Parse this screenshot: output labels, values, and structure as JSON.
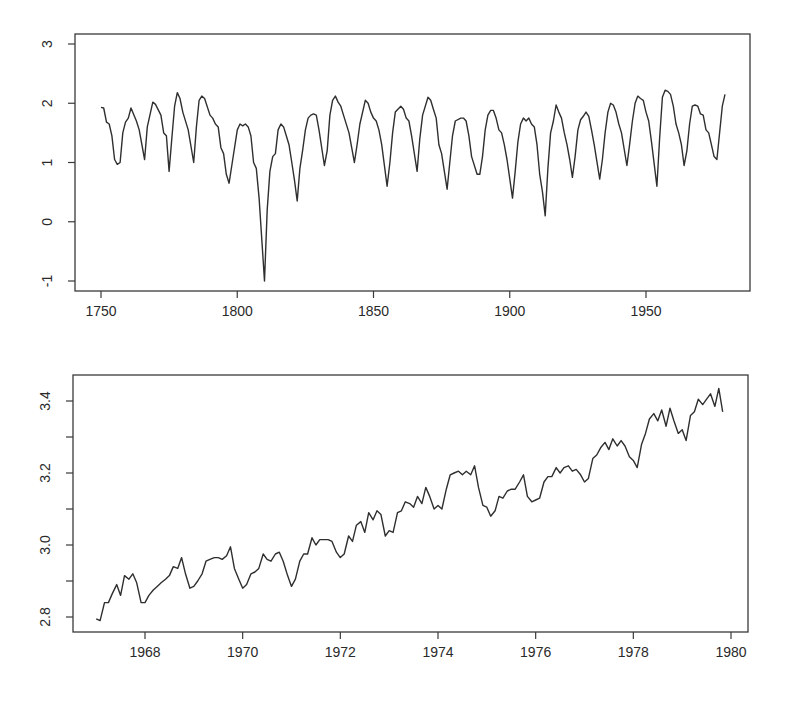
{
  "chart_data": [
    {
      "type": "line",
      "title": "",
      "xlabel": "",
      "ylabel": "",
      "xlim": [
        1740,
        1985
      ],
      "ylim": [
        -1.15,
        3.2
      ],
      "grid": false,
      "legend": null,
      "x_ticks": [
        1750,
        1800,
        1850,
        1900,
        1950
      ],
      "x_tick_labels": [
        "1750",
        "1800",
        "1850",
        "1900",
        "1950"
      ],
      "y_ticks": [
        -1,
        0,
        1,
        2,
        3
      ],
      "y_tick_labels": [
        "-1",
        "0",
        "1",
        "2",
        "3"
      ],
      "series": [
        {
          "name": "series",
          "x": [
            1750,
            1751,
            1752,
            1753,
            1754,
            1755,
            1756,
            1757,
            1758,
            1759,
            1760,
            1761,
            1763,
            1764,
            1766,
            1767,
            1769,
            1770,
            1772,
            1773,
            1774,
            1775,
            1776,
            1777,
            1778,
            1779,
            1780,
            1782,
            1784,
            1785,
            1786,
            1787,
            1788,
            1790,
            1791,
            1792,
            1793,
            1794,
            1795,
            1796,
            1797,
            1798,
            1800,
            1801,
            1802,
            1803,
            1804,
            1805,
            1806,
            1807,
            1808,
            1809,
            1810,
            1811,
            1812,
            1813,
            1814,
            1815,
            1816,
            1817,
            1818,
            1819,
            1820,
            1821,
            1822,
            1823,
            1824,
            1825,
            1826,
            1827,
            1828,
            1829,
            1830,
            1832,
            1833,
            1834,
            1835,
            1836,
            1837,
            1838,
            1839,
            1841,
            1842,
            1843,
            1844,
            1845,
            1847,
            1848,
            1849,
            1850,
            1851,
            1852,
            1853,
            1855,
            1856,
            1857,
            1858,
            1860,
            1861,
            1862,
            1863,
            1864,
            1866,
            1867,
            1868,
            1870,
            1871,
            1872,
            1873,
            1874,
            1875,
            1877,
            1878,
            1879,
            1880,
            1882,
            1883,
            1884,
            1885,
            1886,
            1888,
            1889,
            1890,
            1891,
            1892,
            1893,
            1894,
            1895,
            1896,
            1897,
            1898,
            1899,
            1901,
            1902,
            1903,
            1904,
            1905,
            1906,
            1907,
            1908,
            1909,
            1910,
            1911,
            1912,
            1913,
            1914,
            1915,
            1916,
            1917,
            1918,
            1919,
            1920,
            1921,
            1922,
            1923,
            1924,
            1925,
            1926,
            1927,
            1928,
            1929,
            1930,
            1931,
            1933,
            1934,
            1935,
            1936,
            1937,
            1938,
            1939,
            1940,
            1941,
            1943,
            1944,
            1945,
            1946,
            1947,
            1948,
            1949,
            1950,
            1951,
            1952,
            1954,
            1955,
            1956,
            1957,
            1958,
            1959,
            1960,
            1961,
            1962,
            1963,
            1964,
            1965,
            1966,
            1967,
            1968,
            1969,
            1970,
            1971,
            1972,
            1973,
            1974,
            1975,
            1976,
            1977,
            1978,
            1979
          ],
          "values": [
            1.93,
            1.92,
            1.68,
            1.65,
            1.45,
            1.05,
            0.97,
            1.0,
            1.5,
            1.68,
            1.75,
            1.92,
            1.7,
            1.55,
            1.05,
            1.6,
            2.02,
            1.98,
            1.8,
            1.5,
            1.45,
            0.85,
            1.4,
            1.95,
            2.18,
            2.08,
            1.85,
            1.55,
            1.0,
            1.6,
            2.05,
            2.12,
            2.08,
            1.8,
            1.75,
            1.65,
            1.6,
            1.25,
            1.15,
            0.8,
            0.65,
            0.95,
            1.55,
            1.65,
            1.62,
            1.65,
            1.6,
            1.45,
            1.0,
            0.9,
            0.4,
            -0.3,
            -1.0,
            0.2,
            0.85,
            1.1,
            1.15,
            1.55,
            1.65,
            1.6,
            1.45,
            1.3,
            1.0,
            0.7,
            0.35,
            0.9,
            1.2,
            1.55,
            1.75,
            1.8,
            1.82,
            1.8,
            1.55,
            0.95,
            1.2,
            1.8,
            2.05,
            2.12,
            2.02,
            1.95,
            1.8,
            1.5,
            1.25,
            1.0,
            1.3,
            1.65,
            2.05,
            2.0,
            1.85,
            1.75,
            1.7,
            1.55,
            1.3,
            0.6,
            1.0,
            1.5,
            1.85,
            1.95,
            1.9,
            1.75,
            1.7,
            1.45,
            0.85,
            1.4,
            1.8,
            2.1,
            2.05,
            1.9,
            1.75,
            1.3,
            1.15,
            0.55,
            1.0,
            1.45,
            1.7,
            1.75,
            1.75,
            1.7,
            1.45,
            1.1,
            0.8,
            0.8,
            1.1,
            1.55,
            1.8,
            1.88,
            1.88,
            1.75,
            1.55,
            1.5,
            1.3,
            1.05,
            0.4,
            0.85,
            1.35,
            1.65,
            1.75,
            1.7,
            1.75,
            1.65,
            1.6,
            1.3,
            0.8,
            0.5,
            0.1,
            0.9,
            1.5,
            1.7,
            1.97,
            1.85,
            1.75,
            1.5,
            1.3,
            1.05,
            0.75,
            1.1,
            1.55,
            1.72,
            1.78,
            1.85,
            1.78,
            1.55,
            1.3,
            0.72,
            1.05,
            1.5,
            1.85,
            2.0,
            1.97,
            1.85,
            1.65,
            1.5,
            0.95,
            1.3,
            1.7,
            2.0,
            2.12,
            2.08,
            2.05,
            1.85,
            1.7,
            1.35,
            0.6,
            1.4,
            2.1,
            2.22,
            2.2,
            2.15,
            1.95,
            1.65,
            1.5,
            1.3,
            0.95,
            1.2,
            1.65,
            1.95,
            1.97,
            1.95,
            1.82,
            1.8,
            1.55,
            1.5,
            1.3,
            1.1,
            1.05,
            1.5,
            1.95,
            2.15
          ]
        }
      ]
    },
    {
      "type": "line",
      "title": "",
      "xlabel": "",
      "ylabel": "",
      "xlim": [
        1966.5,
        1980.3
      ],
      "ylim": [
        2.76,
        3.47
      ],
      "grid": false,
      "legend": null,
      "x_ticks": [
        1968,
        1970,
        1972,
        1974,
        1976,
        1978,
        1980
      ],
      "x_tick_labels": [
        "1968",
        "1970",
        "1972",
        "1974",
        "1976",
        "1978",
        "1980"
      ],
      "y_ticks": [
        2.8,
        2.9,
        3.0,
        3.1,
        3.2,
        3.3,
        3.4
      ],
      "y_tick_labels": [
        "2.8",
        "",
        "3.0",
        "",
        "3.2",
        "",
        "3.4"
      ],
      "series": [
        {
          "name": "series",
          "x": [
            1967.0,
            1967.08,
            1967.17,
            1967.25,
            1967.33,
            1967.42,
            1967.5,
            1967.58,
            1967.67,
            1967.75,
            1967.83,
            1967.92,
            1968.0,
            1968.08,
            1968.17,
            1968.25,
            1968.33,
            1968.42,
            1968.5,
            1968.58,
            1968.67,
            1968.75,
            1968.83,
            1968.92,
            1969.0,
            1969.08,
            1969.17,
            1969.25,
            1969.33,
            1969.42,
            1969.5,
            1969.58,
            1969.67,
            1969.75,
            1969.83,
            1969.92,
            1970.0,
            1970.08,
            1970.17,
            1970.25,
            1970.33,
            1970.42,
            1970.5,
            1970.58,
            1970.67,
            1970.75,
            1970.83,
            1970.92,
            1971.0,
            1971.08,
            1971.17,
            1971.25,
            1971.33,
            1971.42,
            1971.5,
            1971.58,
            1971.67,
            1971.75,
            1971.83,
            1971.92,
            1972.0,
            1972.08,
            1972.17,
            1972.25,
            1972.33,
            1972.42,
            1972.5,
            1972.58,
            1972.67,
            1972.75,
            1972.83,
            1972.92,
            1973.0,
            1973.08,
            1973.17,
            1973.25,
            1973.33,
            1973.42,
            1973.5,
            1973.58,
            1973.67,
            1973.75,
            1973.83,
            1973.92,
            1974.0,
            1974.08,
            1974.17,
            1974.25,
            1974.33,
            1974.42,
            1974.5,
            1974.58,
            1974.67,
            1974.75,
            1974.83,
            1974.92,
            1975.0,
            1975.08,
            1975.17,
            1975.25,
            1975.33,
            1975.42,
            1975.5,
            1975.58,
            1975.67,
            1975.75,
            1975.83,
            1975.92,
            1976.0,
            1976.08,
            1976.17,
            1976.25,
            1976.33,
            1976.42,
            1976.5,
            1976.58,
            1976.67,
            1976.75,
            1976.83,
            1976.92,
            1977.0,
            1977.08,
            1977.17,
            1977.25,
            1977.33,
            1977.42,
            1977.5,
            1977.58,
            1977.67,
            1977.75,
            1977.83,
            1977.92,
            1978.0,
            1978.08,
            1978.17,
            1978.25,
            1978.33,
            1978.42,
            1978.5,
            1978.58,
            1978.67,
            1978.75,
            1978.83,
            1978.92,
            1979.0,
            1979.08,
            1979.17,
            1979.25,
            1979.33,
            1979.42,
            1979.5,
            1979.58,
            1979.67,
            1979.75,
            1979.83,
            1979.92
          ],
          "values": [
            2.795,
            2.79,
            2.84,
            2.84,
            2.865,
            2.89,
            2.86,
            2.915,
            2.905,
            2.92,
            2.895,
            2.84,
            2.84,
            2.86,
            2.875,
            2.885,
            2.895,
            2.905,
            2.915,
            2.94,
            2.935,
            2.965,
            2.92,
            2.88,
            2.885,
            2.9,
            2.92,
            2.955,
            2.96,
            2.965,
            2.965,
            2.96,
            2.97,
            2.995,
            2.935,
            2.905,
            2.88,
            2.89,
            2.92,
            2.925,
            2.935,
            2.975,
            2.96,
            2.955,
            2.975,
            2.98,
            2.955,
            2.915,
            2.885,
            2.905,
            2.955,
            2.975,
            2.975,
            3.02,
            3.0,
            3.015,
            3.015,
            3.015,
            3.01,
            2.98,
            2.965,
            2.975,
            3.025,
            3.01,
            3.055,
            3.065,
            3.035,
            3.09,
            3.07,
            3.095,
            3.085,
            3.025,
            3.04,
            3.035,
            3.09,
            3.095,
            3.12,
            3.115,
            3.105,
            3.135,
            3.115,
            3.16,
            3.135,
            3.1,
            3.11,
            3.1,
            3.155,
            3.195,
            3.2,
            3.205,
            3.195,
            3.205,
            3.195,
            3.22,
            3.16,
            3.11,
            3.105,
            3.08,
            3.095,
            3.135,
            3.13,
            3.15,
            3.155,
            3.155,
            3.175,
            3.195,
            3.135,
            3.12,
            3.125,
            3.13,
            3.175,
            3.19,
            3.19,
            3.215,
            3.2,
            3.215,
            3.22,
            3.205,
            3.21,
            3.195,
            3.175,
            3.185,
            3.24,
            3.25,
            3.27,
            3.285,
            3.265,
            3.295,
            3.275,
            3.29,
            3.275,
            3.245,
            3.235,
            3.215,
            3.28,
            3.31,
            3.35,
            3.365,
            3.345,
            3.375,
            3.33,
            3.38,
            3.345,
            3.31,
            3.32,
            3.29,
            3.36,
            3.37,
            3.405,
            3.39,
            3.405,
            3.42,
            3.385,
            3.435,
            3.37
          ]
        }
      ]
    }
  ]
}
